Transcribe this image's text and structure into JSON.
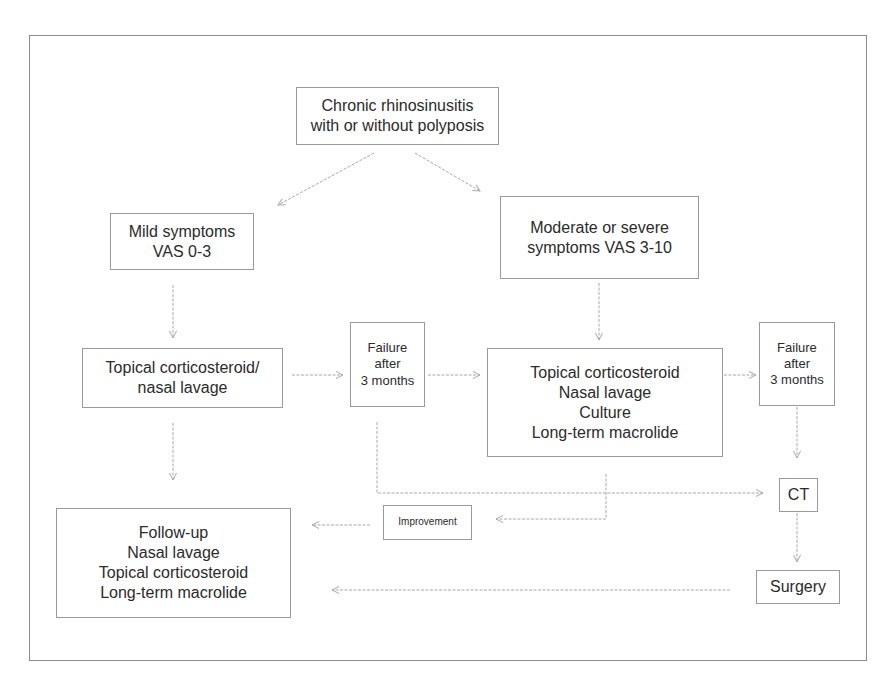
{
  "diagram": {
    "type": "flowchart",
    "colors": {
      "border": "#9a9a9a",
      "frame": "#8a8a8a",
      "text": "#2b2b2b",
      "arrow": "#a8a8a8"
    },
    "nodes": {
      "root": {
        "lines": [
          "Chronic rhinosinusitis",
          "with or without polyposis"
        ]
      },
      "mild": {
        "lines": [
          "Mild symptoms",
          "VAS 0-3"
        ]
      },
      "moderate": {
        "lines": [
          "Moderate or severe",
          "symptoms VAS 3-10"
        ]
      },
      "topical_basic": {
        "lines": [
          "Topical corticosteroid/",
          "nasal lavage"
        ]
      },
      "failure_1": {
        "lines": [
          "Failure",
          "after",
          "3 months"
        ]
      },
      "topical_full": {
        "lines": [
          "Topical corticosteroid",
          "Nasal lavage",
          "Culture",
          "Long-term macrolide"
        ]
      },
      "failure_2": {
        "lines": [
          "Failure",
          "after",
          "3 months"
        ]
      },
      "ct": {
        "lines": [
          "CT"
        ]
      },
      "improvement": {
        "lines": [
          "Improvement"
        ]
      },
      "follow_up": {
        "lines": [
          "Follow-up",
          "Nasal lavage",
          "Topical corticosteroid",
          "Long-term macrolide"
        ]
      },
      "surgery": {
        "lines": [
          "Surgery"
        ]
      }
    },
    "edges": [
      {
        "from": "root",
        "to": "mild"
      },
      {
        "from": "root",
        "to": "moderate"
      },
      {
        "from": "mild",
        "to": "topical_basic"
      },
      {
        "from": "topical_basic",
        "to": "failure_1"
      },
      {
        "from": "topical_basic",
        "to": "follow_up"
      },
      {
        "from": "failure_1",
        "to": "topical_full"
      },
      {
        "from": "failure_1",
        "to": "ct"
      },
      {
        "from": "moderate",
        "to": "topical_full"
      },
      {
        "from": "topical_full",
        "to": "failure_2"
      },
      {
        "from": "topical_full",
        "to": "improvement"
      },
      {
        "from": "failure_2",
        "to": "ct"
      },
      {
        "from": "improvement",
        "to": "follow_up"
      },
      {
        "from": "ct",
        "to": "surgery"
      },
      {
        "from": "surgery",
        "to": "follow_up"
      }
    ]
  }
}
